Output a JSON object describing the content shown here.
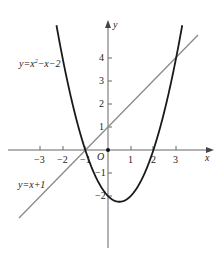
{
  "diagram": {
    "type": "function-graph",
    "axes": {
      "x_label": "x",
      "y_label": "y",
      "origin_label": "O",
      "x_ticks": [
        "−3",
        "−2",
        "−1",
        "1",
        "2",
        "3"
      ],
      "y_ticks": [
        "4",
        "3",
        "2",
        "1",
        "−1",
        "−2"
      ]
    },
    "curves": [
      {
        "name": "parabola",
        "label_y": "y=x",
        "label_sup": "2",
        "label_rest": "−x−2",
        "equation": "y=x^2-x-2",
        "color": "#1a1a1a"
      },
      {
        "name": "line",
        "label": "y=x+1",
        "equation": "y=x+1",
        "color": "#8a8a8a"
      }
    ],
    "intersections": [
      [
        -1,
        0
      ],
      [
        3,
        4
      ]
    ]
  }
}
